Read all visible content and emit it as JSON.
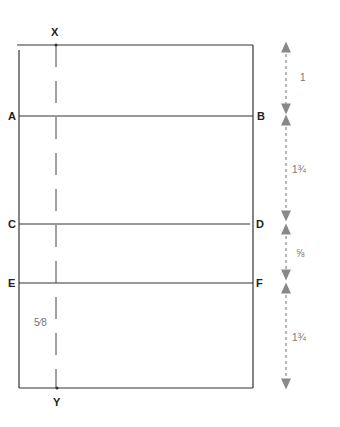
{
  "diagram": {
    "type": "pattern-draft",
    "center_line": {
      "top_label": "X",
      "bottom_label": "Y"
    },
    "points": [
      {
        "id": "A",
        "side": "left"
      },
      {
        "id": "B",
        "side": "right"
      },
      {
        "id": "C",
        "side": "left"
      },
      {
        "id": "D",
        "side": "right"
      },
      {
        "id": "E",
        "side": "left"
      },
      {
        "id": "F",
        "side": "right"
      }
    ],
    "dimensions": [
      {
        "from": "top",
        "to": "A-B",
        "value": "1"
      },
      {
        "from": "A-B",
        "to": "C-D",
        "value": "1¾"
      },
      {
        "from": "C-D",
        "to": "E-F",
        "value": "⅝"
      },
      {
        "from": "E-F",
        "to": "bottom",
        "value": "1¾"
      }
    ],
    "inner_annotation": "5⁄8",
    "colors": {
      "line": "#333333",
      "dimension": "#888888"
    }
  }
}
